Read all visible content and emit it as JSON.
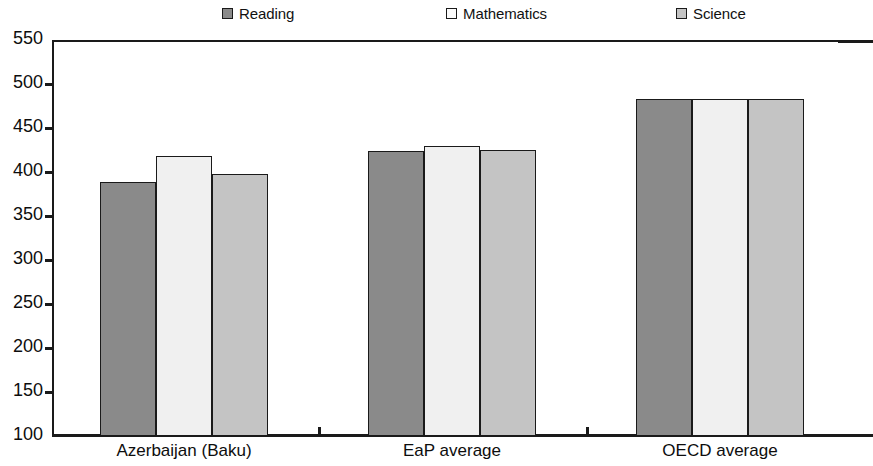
{
  "chart_data": {
    "type": "bar",
    "title": "",
    "subtitle": "",
    "xlabel": "",
    "ylabel": "",
    "ylim": [
      100,
      550
    ],
    "ytick_step": 50,
    "yticks": [
      100,
      150,
      200,
      250,
      300,
      350,
      400,
      450,
      500,
      550
    ],
    "ytick_labels": [
      "100",
      "150",
      "200",
      "250",
      "300",
      "350",
      "400",
      "450",
      "500",
      "550"
    ],
    "grid": false,
    "legend_position": "top",
    "categories": [
      "Azerbaijan (Baku)",
      "EaP average",
      "OECD average"
    ],
    "series": [
      {
        "name": "Reading",
        "values": [
          389,
          424,
          483
        ],
        "color": "#8a8a8a"
      },
      {
        "name": "Mathematics",
        "values": [
          418,
          430,
          483
        ],
        "color": "#f0f0f0"
      },
      {
        "name": "Science",
        "values": [
          398,
          425,
          483
        ],
        "color": "#c4c4c4"
      }
    ],
    "legend": [
      {
        "label": "Reading",
        "swatch_color": "#8a8a8a"
      },
      {
        "label": "Mathematics",
        "swatch_color": "#fbfbfb"
      },
      {
        "label": "Science",
        "swatch_color": "#c4c4c4"
      }
    ],
    "axis_color": "#1a1a1a",
    "bar_border_color": "#1a1a1a",
    "background_color": "#ffffff"
  }
}
